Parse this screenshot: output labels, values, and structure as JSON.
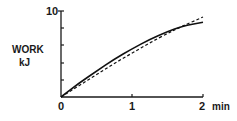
{
  "chart_data": {
    "type": "line",
    "title": "",
    "xlabel": "min",
    "ylabel": "WORK kJ",
    "xlim": [
      0,
      2
    ],
    "ylim": [
      0,
      10
    ],
    "x_ticks": [
      0,
      1,
      2
    ],
    "x_tick_labels": [
      "0",
      "1",
      "2 min"
    ],
    "y_ticks": [
      0,
      2,
      4,
      6,
      8,
      10
    ],
    "y_tick_labels": [
      "",
      "",
      "",
      "",
      "",
      "10"
    ],
    "grid": false,
    "legend": "none",
    "x": [
      0,
      0.25,
      0.5,
      0.75,
      1.0,
      1.25,
      1.5,
      1.7,
      2.0
    ],
    "series": [
      {
        "name": "solid",
        "style": "solid",
        "values": [
          0,
          1.6,
          3.0,
          4.4,
          5.6,
          6.7,
          7.6,
          8.2,
          8.7
        ]
      },
      {
        "name": "dashed",
        "style": "dashed",
        "values": [
          0,
          1.3,
          2.6,
          3.9,
          5.1,
          6.3,
          7.4,
          8.2,
          9.3
        ]
      }
    ]
  },
  "labels": {
    "y_axis_line1": "WORK",
    "y_axis_line2": "kJ",
    "y_top": "10",
    "x0": "0",
    "x1": "1",
    "x2": "2",
    "x_unit": "min"
  }
}
